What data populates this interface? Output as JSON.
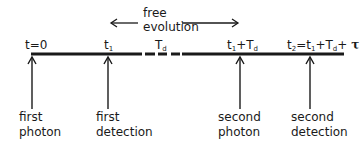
{
  "diagram": {
    "free_evolution_label": [
      "free",
      "evolution"
    ],
    "tick_labels": {
      "t0": "t=0",
      "t1_base": "t",
      "t1_sub": "1",
      "td_base": "T",
      "td_sub": "d",
      "t1td_base1": "t",
      "t1td_sub1": "1",
      "t1td_mid": "+T",
      "t1td_sub2": "d",
      "t2_base": "t",
      "t2_sub": "2",
      "t2_eq": "=t",
      "t2_sub1": "1",
      "t2_plus": "+T",
      "t2_subd": "d",
      "t2_plus2": "+ ",
      "t2_tau": "τ"
    },
    "events": [
      {
        "line1": "first",
        "line2": "photon"
      },
      {
        "line1": "first",
        "line2": "detection"
      },
      {
        "line1": "second",
        "line2": "photon"
      },
      {
        "line1": "second",
        "line2": "detection"
      }
    ],
    "colors": {
      "line": "#1a1a1a",
      "background": "#ffffff"
    }
  }
}
